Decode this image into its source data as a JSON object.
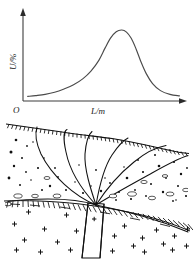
{
  "figure": {
    "caption_visible": false,
    "origin_label": "O",
    "y_axis_label": "U/%",
    "x_axis_label": "L/m",
    "colors": {
      "curve": "#4a4a4a",
      "axis": "#3d3d3d",
      "ink": "#111111",
      "background": "#ffffff"
    },
    "geology": {
      "surface_label": "",
      "overburden_label": "",
      "bedrock_label": "",
      "vein_label": ""
    }
  },
  "chart_data": {
    "type": "line",
    "title": "",
    "subtitle": "",
    "xlabel": "L/m",
    "ylabel": "U/%",
    "xlim": [
      0,
      10
    ],
    "ylim": [
      0,
      10
    ],
    "grid": false,
    "legend": "none",
    "annotations": [
      {
        "text": "O",
        "role": "origin-label"
      },
      {
        "text": "U/%",
        "role": "y-axis-label"
      },
      {
        "text": "L/m",
        "role": "x-axis-label"
      }
    ],
    "series": [
      {
        "name": "Self-potential anomaly",
        "x": [
          0.3,
          0.8,
          1.4,
          2.0,
          2.6,
          3.2,
          3.8,
          4.3,
          4.8,
          5.2,
          5.55,
          5.9,
          6.25,
          6.55,
          6.85,
          7.15,
          7.45,
          7.8,
          8.2,
          8.7,
          9.3,
          9.9
        ],
        "y": [
          0.55,
          0.65,
          0.8,
          1.05,
          1.45,
          1.95,
          2.7,
          3.6,
          4.9,
          6.4,
          7.6,
          8.35,
          8.55,
          8.3,
          7.55,
          6.3,
          4.8,
          3.3,
          2.1,
          1.25,
          0.8,
          0.62
        ]
      }
    ],
    "peak": {
      "x": 6.25,
      "y": 8.55
    },
    "baseline": 0.55
  }
}
